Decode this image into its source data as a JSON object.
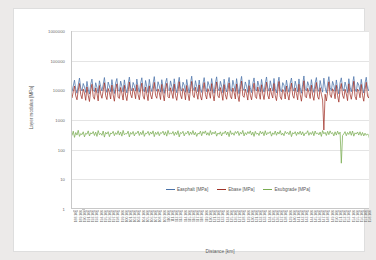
{
  "chart_data": {
    "type": "line",
    "title": "",
    "xlabel": "Distance [km]",
    "ylabel": "Layer modulus [MPa]",
    "yscale": "log",
    "ylim": [
      1,
      1000000
    ],
    "ytick_labels": [
      "1000000",
      "100000",
      "10000",
      "1000",
      "100",
      "10",
      "1"
    ],
    "ytick_values": [
      1000000,
      100000,
      10000,
      1000,
      100,
      10,
      1
    ],
    "grid": true,
    "legend_position": "inside-bottom-center",
    "legend": [
      "Easphalt [MPa]",
      "Ebase [MPa]",
      "Esubgrade [MPa]"
    ],
    "colors": {
      "easphalt": "#4A72A8",
      "ebase": "#A03228",
      "esubgrade": "#79AC51",
      "gridline": "#E4E4E4",
      "axis": "#C8C8C8",
      "tick_text": "#6A6A6A",
      "page_background": "#ECEAE9",
      "plot_background": "#FFFFFF"
    },
    "xtick_labels": [
      "188.100",
      "189.100",
      "190.100",
      "191.100",
      "192.100",
      "193.100",
      "194.100",
      "195.100",
      "196.100",
      "197.100",
      "198.100",
      "199.100",
      "100.100",
      "101.100",
      "102.100",
      "103.100",
      "104.100",
      "105.100",
      "106.100",
      "107.100",
      "108.100",
      "109.100",
      "110.100",
      "111.100",
      "112.100",
      "113.100",
      "114.100",
      "115.100",
      "116.100",
      "117.100",
      "118.100",
      "119.100",
      "120.100",
      "121.100",
      "122.100",
      "123.100",
      "124.100",
      "125.100",
      "126.100",
      "127.100",
      "128.100",
      "129.100",
      "130.100",
      "131.100",
      "132.100",
      "133.100",
      "134.100",
      "135.100",
      "136.100",
      "137.100",
      "138.100",
      "139.100",
      "140.100",
      "141.100",
      "142.100",
      "143.100",
      "144.100",
      "145.100",
      "146.100",
      "147.100",
      "148.100",
      "149.100",
      "150.100",
      "151.100",
      "152.100",
      "153.100",
      "154.100",
      "155.100",
      "156.100",
      "157.100",
      "158.100"
    ],
    "series": [
      {
        "name": "Easphalt [MPa]",
        "color": "#4A72A8",
        "unit": "MPa",
        "approx_range": [
          3000,
          40000
        ],
        "approx_mean": 13000,
        "values": [
          9000,
          14000,
          22000,
          11000,
          8000,
          15000,
          26000,
          12000,
          9500,
          17000,
          13000,
          8500,
          20000,
          11000,
          7500,
          16000,
          24000,
          10500,
          9000,
          18000,
          12500,
          8000,
          21000,
          13500,
          9500,
          15500,
          27000,
          11500,
          8500,
          19000,
          14000,
          9000,
          23000,
          12000,
          7800,
          17500,
          25000,
          10000,
          9200,
          20500,
          13800,
          8800,
          22500,
          11800,
          8200,
          16500,
          28000,
          12200,
          9600,
          18500,
          14500,
          9400,
          24000,
          12800,
          8600,
          17200,
          26500,
          11200,
          8900,
          21500,
          13200,
          8400,
          23500,
          12600,
          9100,
          16800,
          29000,
          11600,
          9300,
          19500,
          14200,
          8700,
          22800,
          12400,
          7900,
          17800,
          25500,
          10800,
          9700,
          20800,
          13600,
          9200,
          24500,
          12100,
          8300,
          16200,
          27500,
          11900,
          9400,
          18800,
          14800,
          8600,
          23200,
          13000,
          8100,
          17000,
          30000,
          12300,
          9800,
          21200,
          13400,
          8900,
          22200,
          11400,
          8500,
          16600,
          26800,
          12700,
          9000,
          19800,
          14600,
          9500,
          25000,
          12900,
          8000,
          17600,
          28500,
          11700,
          9600,
          20200,
          13900,
          8300,
          23800,
          12500,
          8800,
          16400,
          27200,
          11300,
          9200,
          21800,
          14400,
          9100,
          24800,
          12000,
          7700,
          17400,
          29500,
          11800,
          9900,
          19200,
          13700,
          8500,
          22600,
          12200,
          8400,
          16900,
          26200,
          11500,
          9500,
          20600,
          14100,
          8900,
          23400,
          12800,
          8700,
          17100,
          28200,
          12100,
          9300,
          21000,
          13300,
          9600,
          25200,
          11600,
          8200,
          16700,
          27800,
          11000,
          8900,
          18200,
          14900,
          9000,
          22000,
          12400,
          8600,
          17300,
          26000,
          11900,
          9400,
          20400,
          13500,
          8800,
          24200,
          12600,
          8000,
          16100,
          30500,
          11400,
          9700,
          19600,
          14300,
          9300,
          23000,
          12300,
          8500,
          17700,
          27000,
          11100,
          9100,
          21400,
          13100,
          8700,
          25800,
          12700,
          8300,
          16300,
          28800,
          12500,
          9800,
          20000,
          14700,
          9200,
          22400,
          11700,
          7600,
          17900,
          26400,
          12000,
          9500,
          19000,
          13000,
          8400,
          24600,
          12900,
          8900,
          16000,
          29200,
          11300,
          9000,
          18600,
          15000,
          9700,
          23600,
          12100,
          8100,
          17500,
          27600,
          11600,
          9600,
          20900
        ]
      },
      {
        "name": "Ebase [MPa]",
        "color": "#A03228",
        "unit": "MPa",
        "approx_range": [
          400,
          30000
        ],
        "approx_mean": 8000,
        "values": [
          5500,
          9000,
          14000,
          6500,
          4800,
          10000,
          17000,
          7200,
          5200,
          11000,
          8200,
          4600,
          13000,
          6800,
          4200,
          9800,
          16000,
          6200,
          5000,
          12000,
          7800,
          4400,
          14500,
          7600,
          5400,
          9600,
          18000,
          6600,
          4900,
          11500,
          8600,
          5100,
          15000,
          7000,
          4300,
          10500,
          16500,
          5800,
          5300,
          12500,
          8000,
          4700,
          14800,
          6900,
          4500,
          9400,
          19000,
          7400,
          5600,
          11800,
          8800,
          5200,
          15500,
          7300,
          4800,
          10200,
          17500,
          6400,
          5000,
          12800,
          7600,
          4500,
          14200,
          7100,
          5100,
          9900,
          18500,
          6700,
          5400,
          11200,
          8400,
          4900,
          15800,
          7500,
          4400,
          10800,
          17200,
          6100,
          5500,
          12200,
          8200,
          5300,
          16200,
          6800,
          4600,
          9200,
          19500,
          7000,
          5200,
          11600,
          9000,
          4800,
          14600,
          7700,
          4500,
          10400,
          20000,
          6900,
          5700,
          12600,
          7900,
          5000,
          15200,
          6400,
          4700,
          9700,
          18200,
          7200,
          5100,
          11400,
          8500,
          5400,
          16800,
          7400,
          4400,
          10600,
          19200,
          6500,
          5600,
          12400,
          8100,
          4600,
          15600,
          7000,
          5000,
          9500,
          17800,
          6300,
          5200,
          12000,
          8700,
          5100,
          16400,
          6700,
          4200,
          10900,
          20500,
          6600,
          5800,
          11000,
          7700,
          4700,
          14400,
          6900,
          4800,
          9300,
          17400,
          6200,
          5300,
          12900,
          8300,
          5000,
          15400,
          7600,
          4900,
          10100,
          18800,
          6800,
          5100,
          11900,
          7500,
          5500,
          17000,
          6500,
          4500,
          9600,
          19800,
          6000,
          4900,
          10700,
          8900,
          5100,
          14000,
          7100,
          4700,
          10300,
          17600,
          6700,
          5400,
          12100,
          7800,
          4800,
          16000,
          7300,
          4300,
          9100,
          21000,
          6300,
          5600,
          11700,
          8600,
          5300,
          15000,
          6900,
          4600,
          10500,
          18400,
          6100,
          5000,
          12300,
          7400,
          4700,
          460,
          7400,
          4400,
          9000,
          19400,
          7000,
          5700,
          11300,
          9200,
          5200,
          14800,
          6600,
          4000,
          10700,
          17000,
          6800,
          5300,
          10900,
          7600,
          4500,
          16600,
          7500,
          5000,
          8900,
          20200,
          6200,
          4800,
          11100,
          9400,
          5600,
          15800,
          6800,
          4300,
          10400,
          18600,
          6400,
          5500,
          12000
        ]
      },
      {
        "name": "Esubgrade [MPa]",
        "color": "#79AC51",
        "unit": "MPa",
        "approx_range": [
          30,
          900
        ],
        "approx_mean": 330,
        "values": [
          300,
          420,
          260,
          380,
          310,
          450,
          280,
          350,
          320,
          400,
          270,
          360,
          330,
          430,
          290,
          370,
          340,
          410,
          300,
          390,
          280,
          440,
          320,
          355,
          305,
          425,
          265,
          385,
          335,
          405,
          275,
          365,
          345,
          415,
          295,
          375,
          325,
          435,
          310,
          395,
          285,
          445,
          315,
          350,
          340,
          420,
          270,
          380,
          330,
          410,
          290,
          370,
          350,
          425,
          300,
          390,
          320,
          440,
          280,
          360,
          345,
          415,
          305,
          395,
          335,
          430,
          275,
          385,
          325,
          405,
          295,
          375,
          355,
          420,
          310,
          400,
          285,
          445,
          330,
          365,
          340,
          410,
          300,
          390,
          320,
          435,
          270,
          380,
          350,
          415,
          290,
          370,
          345,
          425,
          305,
          395,
          325,
          440,
          315,
          385,
          280,
          360,
          335,
          420,
          295,
          405,
          350,
          430,
          310,
          375,
          300,
          440,
          320,
          390,
          340,
          415,
          285,
          365,
          330,
          400,
          290,
          380,
          345,
          425,
          315,
          395,
          275,
          435,
          325,
          370,
          305,
          410,
          350,
          420,
          300,
          385,
          335,
          445,
          290,
          375,
          320,
          405,
          345,
          430,
          310,
          390,
          280,
          415,
          330,
          365,
          300,
          420,
          340,
          400,
          295,
          435,
          315,
          380,
          350,
          410,
          285,
          370,
          325,
          425,
          305,
          395,
          335,
          440,
          310,
          360,
          295,
          415,
          345,
          385,
          320,
          430,
          275,
          375,
          340,
          405,
          300,
          390,
          330,
          420,
          315,
          400,
          290,
          365,
          350,
          435,
          305,
          380,
          325,
          410,
          295,
          425,
          335,
          370,
          315,
          395,
          280,
          440,
          340,
          385,
          300,
          415,
          320,
          430,
          345,
          375,
          290,
          400,
          310,
          420,
          330,
          390,
          35,
          300,
          340,
          405,
          295,
          380,
          325,
          415,
          305,
          425,
          285,
          370,
          335,
          395,
          310,
          400,
          300,
          380,
          290,
          360,
          305,
          340,
          300,
          200
        ]
      }
    ]
  }
}
